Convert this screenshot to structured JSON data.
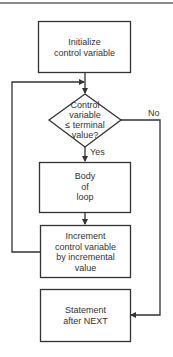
{
  "diagram": {
    "type": "flowchart",
    "colors": {
      "stroke": "#333333",
      "text": "#333333",
      "rule": "#8a8a8a",
      "background": "#ffffff"
    },
    "nodes": {
      "init": {
        "lines": [
          "Initialize",
          "control variable"
        ]
      },
      "decision": {
        "lines": [
          "Control",
          "variable",
          "≤ terminal",
          "value?"
        ]
      },
      "body": {
        "lines": [
          "Body",
          "of",
          "loop"
        ]
      },
      "increment": {
        "lines": [
          "Increment",
          "control variable",
          "by incremental",
          "value"
        ]
      },
      "after": {
        "lines": [
          "Statement",
          "after NEXT"
        ]
      }
    },
    "edges": {
      "yes_label": "Yes",
      "no_label": "No"
    }
  }
}
